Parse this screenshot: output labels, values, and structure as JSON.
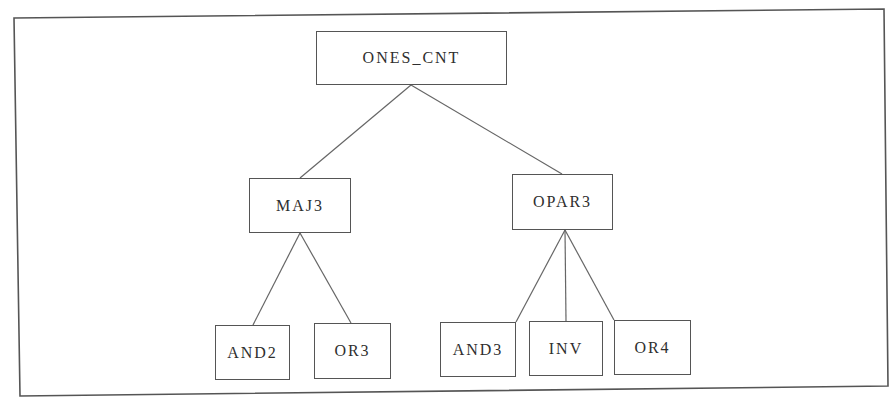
{
  "diagram": {
    "type": "hierarchy-tree",
    "frame": {
      "corners": [
        [
          14,
          18
        ],
        [
          884,
          9
        ],
        [
          888,
          386
        ],
        [
          20,
          396
        ]
      ],
      "stroke": "#555555"
    },
    "colors": {
      "line": "#666666",
      "box_border": "#555555",
      "text": "#2e2e2e",
      "background": "#ffffff"
    },
    "nodes": [
      {
        "id": "ones_cnt",
        "label": "ONES_CNT",
        "x": 316,
        "y": 31,
        "w": 191,
        "h": 54,
        "level": 0
      },
      {
        "id": "maj3",
        "label": "MAJ3",
        "x": 249,
        "y": 178,
        "w": 102,
        "h": 55,
        "level": 1
      },
      {
        "id": "opar3",
        "label": "OPAR3",
        "x": 512,
        "y": 174,
        "w": 101,
        "h": 56,
        "level": 1
      },
      {
        "id": "and2",
        "label": "AND2",
        "x": 215,
        "y": 325,
        "w": 75,
        "h": 55,
        "level": 2
      },
      {
        "id": "or3",
        "label": "OR3",
        "x": 314,
        "y": 323,
        "w": 77,
        "h": 56,
        "level": 2
      },
      {
        "id": "and3",
        "label": "AND3",
        "x": 440,
        "y": 322,
        "w": 76,
        "h": 55,
        "level": 2
      },
      {
        "id": "inv",
        "label": "INV",
        "x": 529,
        "y": 321,
        "w": 74,
        "h": 55,
        "level": 2
      },
      {
        "id": "or4",
        "label": "OR4",
        "x": 614,
        "y": 320,
        "w": 77,
        "h": 55,
        "level": 2
      }
    ],
    "edges": [
      {
        "from": "ones_cnt",
        "to": "maj3",
        "x1": 411,
        "y1": 85,
        "x2": 300,
        "y2": 178
      },
      {
        "from": "ones_cnt",
        "to": "opar3",
        "x1": 411,
        "y1": 85,
        "x2": 562,
        "y2": 174
      },
      {
        "from": "maj3",
        "to": "and2",
        "x1": 300,
        "y1": 233,
        "x2": 253,
        "y2": 325
      },
      {
        "from": "maj3",
        "to": "or3",
        "x1": 300,
        "y1": 233,
        "x2": 351,
        "y2": 323
      },
      {
        "from": "opar3",
        "to": "and3",
        "x1": 565,
        "y1": 230,
        "x2": 516,
        "y2": 322
      },
      {
        "from": "opar3",
        "to": "inv",
        "x1": 565,
        "y1": 230,
        "x2": 566,
        "y2": 321
      },
      {
        "from": "opar3",
        "to": "or4",
        "x1": 565,
        "y1": 230,
        "x2": 614,
        "y2": 320
      }
    ]
  }
}
